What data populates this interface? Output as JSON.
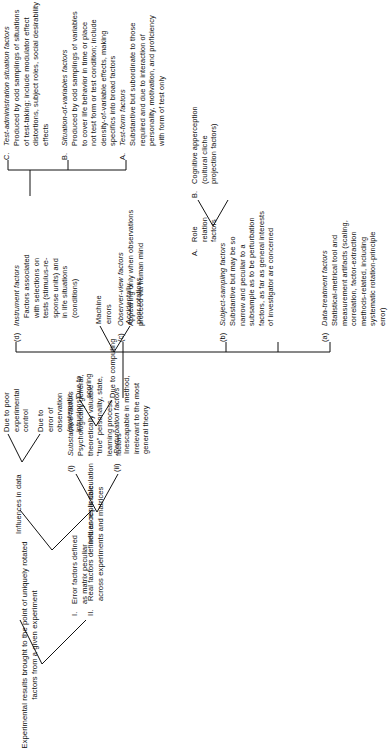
{
  "figure": {
    "type": "tree-diagram",
    "orientation": "rotated-90-ccw",
    "root": {
      "id": "root",
      "label": "Experimental results brought to the point of uniquely rotated\nfactors from a given experiment"
    },
    "branch_I": {
      "number": "I.",
      "label": "Error factors defined\nas matrix peculiar",
      "children": {
        "data": {
          "label": "Influences in data",
          "children": [
            {
              "label": "Due to poor\nexperimental\ncontrol"
            },
            {
              "label": "Due to\nerror of\nobservation\n(systematic\nintrusions)"
            }
          ]
        },
        "calculation": {
          "label": "Influences in calculation",
          "children": [
            {
              "label": "Due to\nscoring"
            },
            {
              "label": "Due to computing",
              "children": [
                {
                  "label": "Machine\nerrors"
                },
                {
                  "label": "Accidentally\npoor rotations"
                }
              ]
            }
          ]
        }
      }
    },
    "branch_II": {
      "number": "II.",
      "label": "Real factors defined as replicable\nacross experiments and matrices",
      "children": [
        {
          "marker": "(i)",
          "title": "Substantive factors",
          "body": "Psychologically general,\ntheoretically valuable\n\"true\" personality, state,\nlearning process\nfactors"
        },
        {
          "marker": "(ii)",
          "title": "Perturbation factors",
          "body": "Inescapable in method,\nirrelevant to the most\ngeneral theory",
          "children": [
            {
              "marker": "(a)",
              "title": "Data-treatment factors",
              "body": "Statistical-metrical tool and\nmeasurement artifacts (scaling,\ncorrelation, factor-extraction\nmethods-related, including\nsystematic rotation-principle\nerror)"
            },
            {
              "marker": "(b)",
              "title": "Subject-sampling factors",
              "body": "Substantive but may be so\nnarrow and peculiar to a\nsubsample as to be perturbation\nfactors, as far as general interests\nof investigator are concerned"
            },
            {
              "marker": "(c)",
              "title": "Observer-view factors",
              "body": "Appearing only when observations\nproceed via human mind",
              "children": [
                {
                  "marker": "A.",
                  "label": "Role\nrelation\nfactors"
                },
                {
                  "marker": "B.",
                  "label": "Cognitive apperception\n(cultural cliche\nprojection factors)"
                }
              ]
            },
            {
              "marker": "(d)",
              "title": "Instrument factors",
              "body": "Factors associated\nwith selections on\ntests (stimulus-re-\nsponse units) and\nin life situations\n(conditions)",
              "children": [
                {
                  "marker": "A.",
                  "title": "Test-form factors",
                  "body": "Substantive but subordinate to those\nrequired and due to interaction of\npersonality, motivation, and proficiency\nwith form of test only"
                },
                {
                  "marker": "B.",
                  "title": "Situation-of-variables factors",
                  "body": "Produced by odd samplings of variables\nto cover life behavior in time or place\nnot test form or test condition; include\ndensity-of-variable effects, making\nspecifics into broad factors"
                },
                {
                  "marker": "C.",
                  "title": "Test-administration situation factors",
                  "body": "Produced by odd samplings of situations\nof test-taking; include modulator effect\ndistortions, subject roles, social desirability\neffects"
                }
              ]
            }
          ]
        }
      ]
    }
  }
}
